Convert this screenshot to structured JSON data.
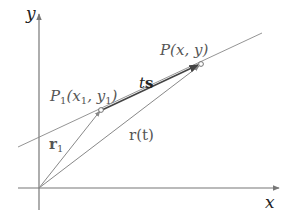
{
  "diagram": {
    "colors": {
      "axis": "#777777",
      "line": "#888888",
      "ts_vector": "#444444",
      "label": "#555555",
      "axis_label": "#222222"
    },
    "axes": {
      "x_label": "x",
      "y_label": "y"
    },
    "points": {
      "p1_label_main": "P",
      "p1_label_sub": "1",
      "p1_coords_open": "(x",
      "p1_coords_sub1": "1",
      "p1_coords_mid": ", y",
      "p1_coords_sub2": "1",
      "p1_coords_close": ")",
      "p_label": "P(x, y)"
    },
    "vectors": {
      "r1_main": "r",
      "r1_sub": "1",
      "rt_label": "r(t)",
      "ts_t": "t",
      "ts_s": "s"
    }
  }
}
